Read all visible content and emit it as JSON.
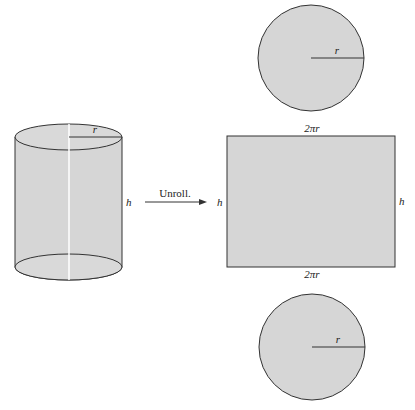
{
  "diagram": {
    "colors": {
      "fill": "#d6d6d6",
      "stroke": "#333333",
      "seam": "#ffffff",
      "text": "#222222"
    },
    "cylinder": {
      "radius_label": "r",
      "height_label": "h"
    },
    "arrow": {
      "label": "Unroll."
    },
    "top_circle": {
      "radius_label": "r"
    },
    "rectangle": {
      "top_label": "2πr",
      "bottom_label": "2πr",
      "left_label": "h",
      "right_label": "h"
    },
    "bottom_circle": {
      "radius_label": "r"
    }
  }
}
